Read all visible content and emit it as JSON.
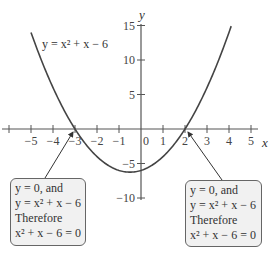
{
  "chart_data": {
    "type": "line",
    "title": "",
    "xlabel": "x",
    "ylabel": "y",
    "function": "y = x^2 + x - 6",
    "curve_label": "y = x² + x − 6",
    "x_ticks": [
      -6,
      -5,
      -4,
      -3,
      -2,
      -1,
      0,
      1,
      2,
      3,
      4,
      5
    ],
    "x_tick_labels": [
      "−5",
      "−4",
      "−3",
      "−2",
      "−1",
      "0",
      "1",
      "2",
      "3",
      "4",
      "5"
    ],
    "y_ticks": [
      15,
      10,
      5,
      -5,
      -10
    ],
    "y_tick_labels": [
      "15",
      "10",
      "5",
      "−5",
      "−10"
    ],
    "xlim": [
      -6.3,
      5.6
    ],
    "ylim": [
      -10.5,
      16
    ],
    "grid": false,
    "x": [
      -5,
      -4,
      -3,
      -2,
      -1,
      -0.5,
      0,
      1,
      2,
      3,
      4
    ],
    "values": [
      14,
      6,
      0,
      -4,
      -6,
      -6.25,
      -6,
      -4,
      0,
      6,
      14
    ],
    "roots": [
      -3,
      2
    ],
    "annotations": [
      {
        "target_x": -3,
        "target_y": 0,
        "lines": [
          "y = 0, and",
          "y = x² + x − 6",
          "Therefore",
          "x² + x − 6 = 0"
        ]
      },
      {
        "target_x": 2,
        "target_y": 0,
        "lines": [
          "y = 0, and",
          "y = x² + x − 6",
          "Therefore",
          "x² + x − 6 = 0"
        ]
      }
    ]
  },
  "labels": {
    "x_axis": "x",
    "y_axis": "y",
    "curve": "y = x² + x − 6"
  },
  "notes": {
    "left": {
      "l1": "y = 0, and",
      "l2": "y = x² + x − 6",
      "l3": "Therefore",
      "l4": "x² + x − 6 = 0"
    },
    "right": {
      "l1": "y = 0, and",
      "l2": "y = x² + x − 6",
      "l3": "Therefore",
      "l4": "x² + x − 6 = 0"
    }
  }
}
